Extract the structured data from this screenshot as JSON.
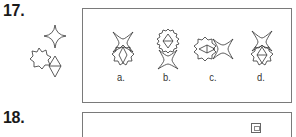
{
  "questions": [
    {
      "number": "17.",
      "prompt_figures": [
        "four-point-star",
        "eight-point-star-octagon",
        "diamond-with-midline"
      ],
      "options": [
        {
          "label": "a.",
          "description": "star above octagon-star containing diamond"
        },
        {
          "label": "b.",
          "description": "sawtooth circle containing diamond above star"
        },
        {
          "label": "c.",
          "description": "octagon-star with horizontal diamond left of star"
        },
        {
          "label": "d.",
          "description": "star above octagon-star containing diamond with midline"
        }
      ]
    },
    {
      "number": "18.",
      "prompt_figures": [],
      "options": []
    }
  ],
  "colors": {
    "ink": "#333333",
    "border": "#7a7a7a",
    "background": "#ffffff"
  }
}
